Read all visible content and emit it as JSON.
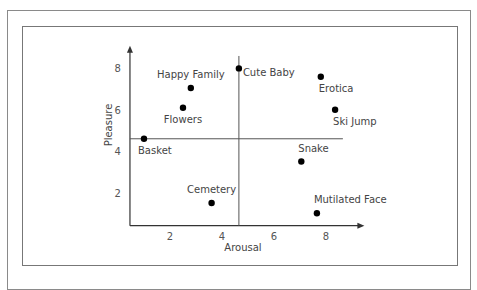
{
  "chart_data": {
    "type": "scatter",
    "title": "",
    "xlabel": "Arousal",
    "ylabel": "Pleasure",
    "xlim": [
      0.46,
      9.4
    ],
    "ylim": [
      0.4,
      9.0
    ],
    "xticks": [
      2,
      4,
      6,
      8
    ],
    "yticks": [
      2,
      4,
      6,
      8
    ],
    "grid": false,
    "dividers": {
      "vertical_x": 4.65,
      "horizontal_y": 4.6
    },
    "points": [
      {
        "label": "Happy Family",
        "x": 2.8,
        "y": 7.05,
        "label_pos": "above"
      },
      {
        "label": "Flowers",
        "x": 2.5,
        "y": 6.1,
        "label_pos": "below"
      },
      {
        "label": "Cute Baby",
        "x": 4.65,
        "y": 8.0,
        "label_pos": "right-below"
      },
      {
        "label": "Erotica",
        "x": 7.8,
        "y": 7.6,
        "label_pos": "below"
      },
      {
        "label": "Ski Jump",
        "x": 8.35,
        "y": 6.0,
        "label_pos": "below"
      },
      {
        "label": "Basket",
        "x": 1.0,
        "y": 4.6,
        "label_pos": "below"
      },
      {
        "label": "Snake",
        "x": 7.05,
        "y": 3.5,
        "label_pos": "above"
      },
      {
        "label": "Cemetery",
        "x": 3.6,
        "y": 1.5,
        "label_pos": "above"
      },
      {
        "label": "Mutilated Face",
        "x": 7.65,
        "y": 1.0,
        "label_pos": "above"
      }
    ]
  },
  "colors": {
    "axis": "#333333",
    "point": "#000000",
    "frame": "#888888"
  }
}
